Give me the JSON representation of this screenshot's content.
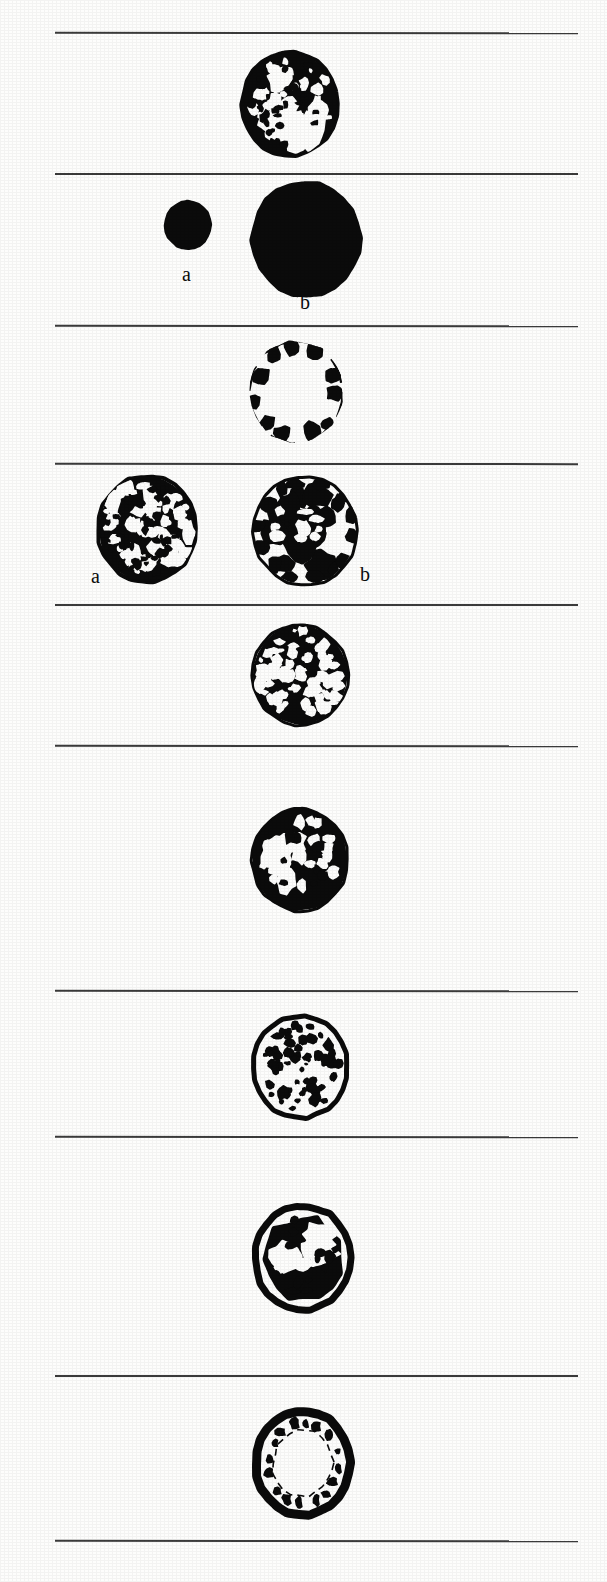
{
  "figure": {
    "width": 607,
    "height": 1582,
    "background_color": "#fdfdfc",
    "ink_color": "#0b0b0b",
    "rule_color": "#3b3b3b",
    "rule_left": 55,
    "rule_right": 578,
    "rule_thickness": 2,
    "rule_positions": [
      32,
      173,
      325,
      463,
      604,
      745,
      990,
      1136,
      1375,
      1540
    ],
    "panel_count": 9
  },
  "labels": [
    {
      "text": "a",
      "x": 182,
      "y": 264
    },
    {
      "text": "b",
      "x": 300,
      "y": 292
    },
    {
      "text": "a",
      "x": 91,
      "y": 566
    },
    {
      "text": "b",
      "x": 360,
      "y": 564
    }
  ],
  "panels": [
    {
      "index": 1,
      "name": "panel-reticulate-cavities",
      "band_top": 32,
      "band_bottom": 173,
      "items": [
        {
          "name": "section-reticulate",
          "label": "",
          "cx": 290,
          "cy": 104,
          "rx": 48,
          "ry": 52,
          "pattern": "reticulate-network",
          "fill_ratio": 0.62
        }
      ]
    },
    {
      "index": 2,
      "name": "panel-solid-pair",
      "band_top": 173,
      "band_bottom": 325,
      "items": [
        {
          "name": "section-solid-small",
          "label": "a",
          "cx": 188,
          "cy": 225,
          "rx": 24,
          "ry": 25,
          "pattern": "solid",
          "fill_ratio": 1.0
        },
        {
          "name": "section-solid-large",
          "label": "b",
          "cx": 306,
          "cy": 239,
          "rx": 56,
          "ry": 58,
          "pattern": "solid",
          "fill_ratio": 1.0
        }
      ]
    },
    {
      "index": 3,
      "name": "panel-peripheral-blots",
      "band_top": 325,
      "band_bottom": 463,
      "items": [
        {
          "name": "section-peripheral-ring-blots",
          "label": "",
          "cx": 296,
          "cy": 392,
          "rx": 47,
          "ry": 51,
          "pattern": "peripheral-blots",
          "fill_ratio": 0.3
        }
      ]
    },
    {
      "index": 4,
      "name": "panel-mottled-pair",
      "band_top": 463,
      "band_bottom": 604,
      "items": [
        {
          "name": "section-fine-mottled",
          "label": "a",
          "cx": 147,
          "cy": 529,
          "rx": 49,
          "ry": 53,
          "pattern": "fine-mottled",
          "fill_ratio": 0.6
        },
        {
          "name": "section-coarse-mottled",
          "label": "b",
          "cx": 305,
          "cy": 531,
          "rx": 52,
          "ry": 54,
          "pattern": "coarse-mottled",
          "fill_ratio": 0.55
        }
      ]
    },
    {
      "index": 5,
      "name": "panel-dense-speckled",
      "band_top": 604,
      "band_bottom": 745,
      "items": [
        {
          "name": "section-dense-speckled",
          "label": "",
          "cx": 300,
          "cy": 675,
          "rx": 48,
          "ry": 50,
          "pattern": "dense-speckled",
          "fill_ratio": 0.8
        }
      ]
    },
    {
      "index": 6,
      "name": "panel-irregular-patches",
      "band_top": 745,
      "band_bottom": 990,
      "items": [
        {
          "name": "section-irregular-patches",
          "label": "",
          "cx": 300,
          "cy": 860,
          "rx": 48,
          "ry": 51,
          "pattern": "irregular-patches",
          "fill_ratio": 0.65
        }
      ]
    },
    {
      "index": 7,
      "name": "panel-sparse-granules",
      "band_top": 990,
      "band_bottom": 1136,
      "items": [
        {
          "name": "section-sparse-granules",
          "label": "",
          "cx": 300,
          "cy": 1067,
          "rx": 47,
          "ry": 51,
          "pattern": "sparse-granules-thick-wall",
          "fill_ratio": 0.22
        }
      ]
    },
    {
      "index": 8,
      "name": "panel-thick-wall-lobed",
      "band_top": 1136,
      "band_bottom": 1375,
      "items": [
        {
          "name": "section-thick-wall-lobed-core",
          "label": "",
          "cx": 303,
          "cy": 1258,
          "rx": 48,
          "ry": 52,
          "pattern": "thick-wall-lobed-core",
          "fill_ratio": 0.55
        }
      ]
    },
    {
      "index": 9,
      "name": "panel-hollow-thick-wall",
      "band_top": 1375,
      "band_bottom": 1540,
      "items": [
        {
          "name": "section-hollow-thick-wall",
          "label": "",
          "cx": 303,
          "cy": 1463,
          "rx": 47,
          "ry": 52,
          "pattern": "hollow-thick-wall",
          "fill_ratio": 0.28
        }
      ]
    }
  ]
}
